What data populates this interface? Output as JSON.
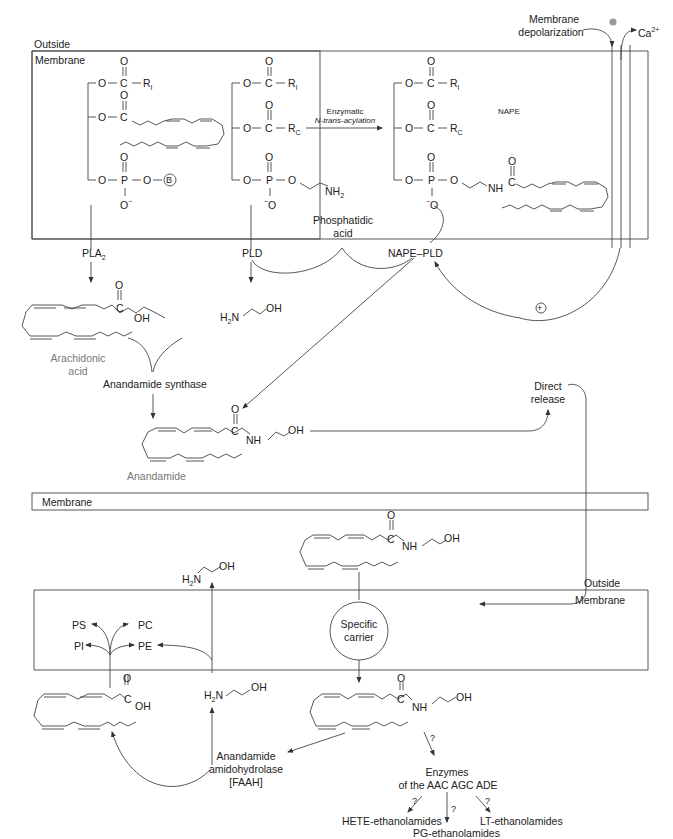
{
  "regions": {
    "top_outside": "Outside",
    "top_membrane": "Membrane",
    "middle_membrane": "Membrane",
    "bottom_outside": "Outside",
    "bottom_membrane": "Membrane"
  },
  "top": {
    "phospholipid_left": {
      "o1": "O",
      "c1": "C",
      "r1": "R",
      "r1_sub": "I",
      "o2": "O",
      "c2": "C",
      "o_p": "O",
      "p": "P",
      "o_b": "O",
      "b_circle": "B",
      "o_minus": "O"
    },
    "pe": {
      "r1": "R",
      "r1_sub": "I",
      "rc": "R",
      "rc_sub": "C",
      "nh2": "NH",
      "nh2_sub": "2"
    },
    "reaction_label_1": "Enzymatic",
    "reaction_label_2": "N-trans-acylation",
    "nape_label": "NAPE",
    "nape": {
      "r1": "R",
      "r1_sub": "I",
      "rc": "R",
      "rc_sub": "C",
      "nh": "NH"
    },
    "depolarization_1": "Membrane",
    "depolarization_2": "depolarization",
    "calcium": "Ca",
    "calcium_sup": "2+",
    "phosphatidic_1": "Phosphatidic",
    "phosphatidic_2": "acid"
  },
  "enzymes": {
    "pla2": "PLA",
    "pla2_sub": "2",
    "pld": "PLD",
    "nape_pld": "NAPE–PLD",
    "anandamide_synthase": "Anandamide synthase",
    "plus_sign": "+"
  },
  "molecules": {
    "arachidonic_1": "Arachidonic",
    "arachidonic_2": "acid",
    "anandamide": "Anandamide",
    "ethanolamine_h2n": "H",
    "ethanolamine_oh": "OH",
    "oh": "OH",
    "nh": "NH",
    "o": "O",
    "c": "C",
    "n": "N",
    "two": "2"
  },
  "direct_release_1": "Direct",
  "direct_release_2": "release",
  "bottom": {
    "specific_carrier_1": "Specific",
    "specific_carrier_2": "carrier",
    "ps": "PS",
    "pc": "PC",
    "pi": "PI",
    "pe": "PE",
    "faah_1": "Anandamide",
    "faah_2": "amidohydrolase",
    "faah_3": "[FAAH]",
    "enzymes_1": "Enzymes",
    "enzymes_2": "of the AAC AGC ADE",
    "question": "?",
    "hete": "HETE-ethanolamides",
    "pg": "PG-ethanolamides",
    "lt": "LT-ethanolamides"
  },
  "colors": {
    "line": "#333333",
    "text": "#222222",
    "gray_text": "#777777"
  }
}
